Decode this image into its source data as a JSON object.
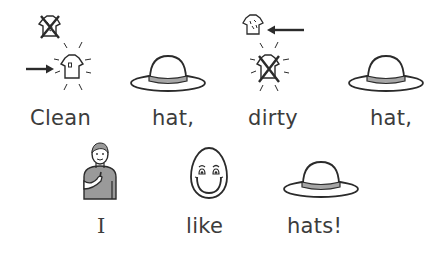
{
  "sentence_1": {
    "words": [
      {
        "text": "Clean",
        "symbol": "clean-shirt-icon"
      },
      {
        "text": "hat,",
        "symbol": "hat-icon"
      },
      {
        "text": "dirty",
        "symbol": "dirty-shirt-icon"
      },
      {
        "text": "hat,",
        "symbol": "hat-icon"
      }
    ]
  },
  "sentence_2": {
    "words": [
      {
        "text": "I",
        "symbol": "person-pointing-self-icon"
      },
      {
        "text": "like",
        "symbol": "smiling-face-icon"
      },
      {
        "text": "hats!",
        "symbol": "hat-icon"
      }
    ]
  },
  "colors": {
    "stroke": "#2b2b2b",
    "hat_band": "#a6a6a6",
    "shirt_fill": "#9a9a9a",
    "text": "#3c3c3c",
    "background": "#ffffff"
  }
}
